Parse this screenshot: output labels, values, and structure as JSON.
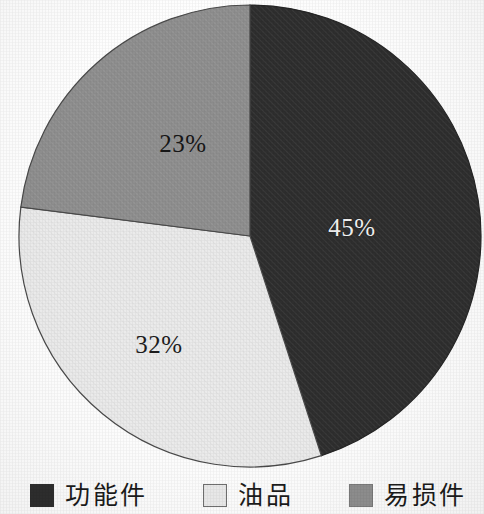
{
  "chart_data": {
    "type": "pie",
    "title": "",
    "subtitle": "",
    "xlabel": "",
    "ylabel": "",
    "categories": [
      "功能件",
      "油品",
      "易损件"
    ],
    "values": [
      45,
      32,
      23
    ],
    "value_labels": [
      "45%",
      "32%",
      "23%"
    ],
    "units": "percent",
    "start_angle_deg": 0,
    "direction": "clockwise",
    "legend_position": "bottom",
    "grid": false,
    "slices": [
      {
        "label": "功能件",
        "value": 45,
        "value_label": "45%",
        "color": "#2e2e2e",
        "label_color": "#f2f2f2",
        "start_deg": 0,
        "end_deg": 162
      },
      {
        "label": "油品",
        "value": 32,
        "value_label": "32%",
        "color": "#ebebeb",
        "label_color": "#1d1d1d",
        "start_deg": 162,
        "end_deg": 277.2
      },
      {
        "label": "易损件",
        "value": 23,
        "value_label": "23%",
        "color": "#8e8e8e",
        "label_color": "#171717",
        "start_deg": 277.2,
        "end_deg": 360
      }
    ]
  },
  "pie": {
    "center_x": 250,
    "center_y": 236,
    "radius": 231,
    "outline_color": "#3a3a3a",
    "label_positions": [
      {
        "x": 352,
        "y": 228
      },
      {
        "x": 159,
        "y": 345
      },
      {
        "x": 183,
        "y": 144
      }
    ]
  },
  "legend": {
    "items": [
      {
        "label": "功能件",
        "color": "#2e2e2e",
        "border": "#2e2e2e",
        "x": 30
      },
      {
        "label": "油品",
        "color": "#e9e9e9",
        "border": "#6f6f6f",
        "x": 203
      },
      {
        "label": "易损件",
        "color": "#8e8e8e",
        "border": "#7a7a7a",
        "x": 349
      }
    ]
  }
}
